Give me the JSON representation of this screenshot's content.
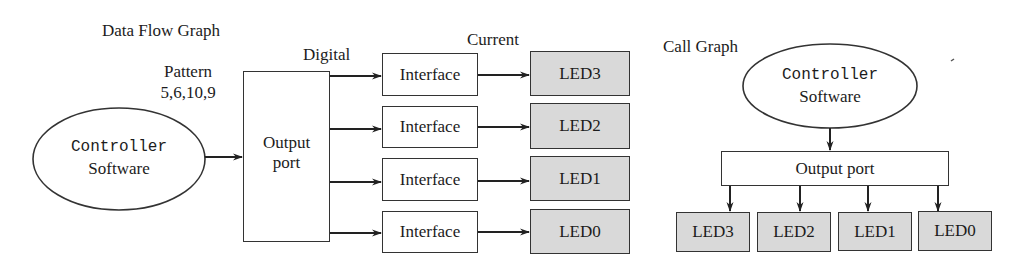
{
  "data_flow_graph": {
    "title": "Data Flow Graph",
    "pattern_label": "Pattern",
    "pattern_values": "5,6,10,9",
    "digital_label": "Digital",
    "current_label": "Current",
    "controller": {
      "line1": "Controller",
      "line2": "Software"
    },
    "output_port": {
      "line1": "Output",
      "line2": "port"
    },
    "interfaces": [
      "Interface",
      "Interface",
      "Interface",
      "Interface"
    ],
    "leds": [
      "LED3",
      "LED2",
      "LED1",
      "LED0"
    ]
  },
  "call_graph": {
    "title": "Call Graph",
    "controller": {
      "line1": "Controller",
      "line2": "Software"
    },
    "output_port": "Output port",
    "leds": [
      "LED3",
      "LED2",
      "LED1",
      "LED0"
    ]
  },
  "colors": {
    "stroke": "#333333",
    "led_fill": "#d9d9d9",
    "box_fill": "#ffffff"
  }
}
